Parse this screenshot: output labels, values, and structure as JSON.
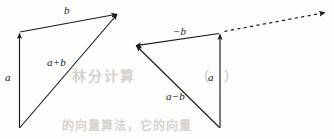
{
  "figure": {
    "background_color": "#fdfdfc",
    "stroke_color": "#1a1a1a",
    "label_color": "#1a1a1a",
    "watermark_color": "#d6d2cb",
    "width": 334,
    "height": 139
  },
  "diagrams": [
    {
      "id": "vector-addition",
      "name": "vector-addition-diagram",
      "labels": {
        "a": "a",
        "b": "b",
        "sum": "a+b"
      }
    },
    {
      "id": "vector-subtraction",
      "name": "vector-subtraction-diagram",
      "labels": {
        "a": "a",
        "neg_b": "−b",
        "difference": "a−b"
      }
    }
  ],
  "labels": {
    "left_a": "a",
    "left_b": "b",
    "left_sum": "a+b",
    "right_neg_b": "−b",
    "right_a": "a",
    "right_difference": "a−b"
  },
  "watermarks": {
    "center_upper": "林分计算",
    "center_right": "（　）",
    "bottom": "的向量算法，它的向量"
  }
}
